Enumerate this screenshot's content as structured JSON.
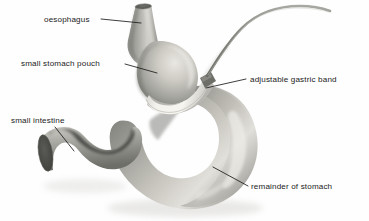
{
  "figure": {
    "type": "anatomical-diagram",
    "background_color": "#fefefe",
    "ink_color": "#1b1b1b",
    "organ_tint": "#9a9a96",
    "organ_highlight": "#e6e4df",
    "organ_shadow": "#6f6f6b",
    "band_color": "#f2f0ea",
    "lumen_color": "#5b5b58"
  },
  "labels": {
    "oesophagus": {
      "text": "oesophagus",
      "text_x": 44,
      "text_y": 22,
      "leader": "M101,19 L141,23"
    },
    "small_stomach_pouch": {
      "text": "small stomach pouch",
      "text_x": 21,
      "text_y": 66,
      "leader": "M125,64 L157,73"
    },
    "adjustable_gastric_band": {
      "text": "adjustable gastric band",
      "text_x": 250,
      "text_y": 82,
      "leader": "M246,79 L206,88"
    },
    "small_intestine": {
      "text": "small intestine",
      "text_x": 11,
      "text_y": 123,
      "leader": "M55,127 L74,151"
    },
    "remainder_of_stomach": {
      "text": "remainder of stomach",
      "text_x": 251,
      "text_y": 189,
      "leader": "M248,186 L213,167"
    }
  },
  "anatomy": {
    "oesophagus_label": "oesophagus tube",
    "pouch_label": "small stomach pouch",
    "band_label": "adjustable gastric band",
    "band_tube_label": "band connecting tube",
    "stomach_label": "remainder of stomach",
    "intestine_label": "small intestine (duodenum)"
  }
}
